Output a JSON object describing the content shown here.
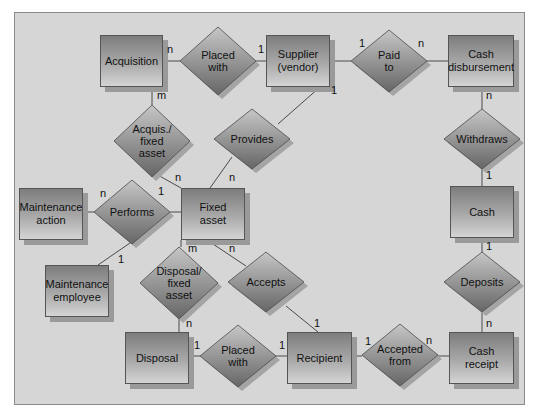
{
  "diagram": {
    "type": "entity-relationship",
    "entities": [
      {
        "id": "acquisition",
        "label": "Acquisition",
        "x": 100,
        "y": 35,
        "w": 63,
        "h": 52
      },
      {
        "id": "supplier",
        "label": "Supplier\n(vendor)",
        "x": 266,
        "y": 35,
        "w": 64,
        "h": 52
      },
      {
        "id": "cash_disbursement",
        "label": "Cash\ndisbursement",
        "x": 448,
        "y": 35,
        "w": 66,
        "h": 52
      },
      {
        "id": "maintenance_action",
        "label": "Maintenance\naction",
        "x": 19,
        "y": 188,
        "w": 64,
        "h": 52
      },
      {
        "id": "fixed_asset",
        "label": "Fixed\nasset",
        "x": 181,
        "y": 188,
        "w": 64,
        "h": 52
      },
      {
        "id": "cash",
        "label": "Cash",
        "x": 450,
        "y": 186,
        "w": 64,
        "h": 52
      },
      {
        "id": "maintenance_employee",
        "label": "Maintenance\nemployee",
        "x": 45,
        "y": 265,
        "w": 64,
        "h": 52
      },
      {
        "id": "disposal",
        "label": "Disposal",
        "x": 125,
        "y": 332,
        "w": 64,
        "h": 52
      },
      {
        "id": "recipient",
        "label": "Recipient",
        "x": 287,
        "y": 332,
        "w": 65,
        "h": 52
      },
      {
        "id": "cash_receipt",
        "label": "Cash\nreceipt",
        "x": 449,
        "y": 332,
        "w": 65,
        "h": 52
      }
    ],
    "relationships": [
      {
        "id": "placed_with_top",
        "label": "Placed\nwith",
        "cx": 218,
        "cy": 61,
        "hw": 38,
        "hh": 34
      },
      {
        "id": "paid_to",
        "label": "Paid\nto",
        "cx": 389,
        "cy": 61,
        "hw": 38,
        "hh": 31
      },
      {
        "id": "acquis_fixed_asset",
        "label": "Acquis./\nfixed\nasset",
        "cx": 152,
        "cy": 141,
        "hw": 38,
        "hh": 36
      },
      {
        "id": "provides",
        "label": "Provides",
        "cx": 252,
        "cy": 139,
        "hw": 38,
        "hh": 30
      },
      {
        "id": "withdraws",
        "label": "Withdraws",
        "cx": 482,
        "cy": 139,
        "hw": 38,
        "hh": 30
      },
      {
        "id": "performs",
        "label": "Performs",
        "cx": 132,
        "cy": 212,
        "hw": 38,
        "hh": 32
      },
      {
        "id": "disposal_fixed_asset",
        "label": "Disposal/\nfixed\nasset",
        "cx": 179,
        "cy": 283,
        "hw": 39,
        "hh": 36
      },
      {
        "id": "accepts",
        "label": "Accepts",
        "cx": 266,
        "cy": 282,
        "hw": 38,
        "hh": 30
      },
      {
        "id": "deposits",
        "label": "Deposits",
        "cx": 482,
        "cy": 282,
        "hw": 38,
        "hh": 30
      },
      {
        "id": "placed_with_bottom",
        "label": "Placed\nwith",
        "cx": 238,
        "cy": 356,
        "hw": 38,
        "hh": 31
      },
      {
        "id": "accepted_from",
        "label": "Accepted\nfrom",
        "cx": 400,
        "cy": 355,
        "hw": 38,
        "hh": 31
      }
    ],
    "connectors": [
      {
        "from": [
          163,
          61
        ],
        "to": [
          180,
          61
        ]
      },
      {
        "from": [
          256,
          61
        ],
        "to": [
          266,
          61
        ]
      },
      {
        "from": [
          330,
          61
        ],
        "to": [
          351,
          61
        ]
      },
      {
        "from": [
          427,
          61
        ],
        "to": [
          448,
          61
        ]
      },
      {
        "from": [
          152,
          87
        ],
        "to": [
          152,
          105
        ]
      },
      {
        "from": [
          156,
          174
        ],
        "to": [
          181,
          188
        ]
      },
      {
        "from": [
          320,
          87
        ],
        "to": [
          278,
          124
        ]
      },
      {
        "from": [
          232,
          157
        ],
        "to": [
          210,
          188
        ]
      },
      {
        "from": [
          482,
          87
        ],
        "to": [
          482,
          109
        ]
      },
      {
        "from": [
          482,
          169
        ],
        "to": [
          482,
          186
        ]
      },
      {
        "from": [
          83,
          212
        ],
        "to": [
          94,
          212
        ]
      },
      {
        "from": [
          170,
          212
        ],
        "to": [
          181,
          212
        ]
      },
      {
        "from": [
          130,
          243
        ],
        "to": [
          98,
          265
        ]
      },
      {
        "from": [
          181,
          240
        ],
        "to": [
          181,
          247
        ]
      },
      {
        "from": [
          179,
          319
        ],
        "to": [
          179,
          332
        ]
      },
      {
        "from": [
          207,
          240
        ],
        "to": [
          246,
          266
        ]
      },
      {
        "from": [
          286,
          306
        ],
        "to": [
          318,
          332
        ]
      },
      {
        "from": [
          482,
          238
        ],
        "to": [
          482,
          252
        ]
      },
      {
        "from": [
          482,
          312
        ],
        "to": [
          482,
          332
        ]
      },
      {
        "from": [
          189,
          356
        ],
        "to": [
          200,
          356
        ]
      },
      {
        "from": [
          276,
          356
        ],
        "to": [
          287,
          356
        ]
      },
      {
        "from": [
          352,
          356
        ],
        "to": [
          362,
          356
        ]
      },
      {
        "from": [
          438,
          356
        ],
        "to": [
          449,
          356
        ]
      }
    ],
    "cardinalities": [
      {
        "text": "n",
        "x": 167,
        "y": 44
      },
      {
        "text": "1",
        "x": 258,
        "y": 44
      },
      {
        "text": "m",
        "x": 157,
        "y": 90
      },
      {
        "text": "1",
        "x": 359,
        "y": 38
      },
      {
        "text": "n",
        "x": 418,
        "y": 38
      },
      {
        "text": "1",
        "x": 331,
        "y": 85
      },
      {
        "text": "n",
        "x": 486,
        "y": 90
      },
      {
        "text": "n",
        "x": 175,
        "y": 172
      },
      {
        "text": "n",
        "x": 229,
        "y": 172
      },
      {
        "text": "1",
        "x": 486,
        "y": 170
      },
      {
        "text": "n",
        "x": 100,
        "y": 188
      },
      {
        "text": "1",
        "x": 158,
        "y": 186
      },
      {
        "text": "1",
        "x": 118,
        "y": 254
      },
      {
        "text": "m",
        "x": 188,
        "y": 243
      },
      {
        "text": "n",
        "x": 229,
        "y": 243
      },
      {
        "text": "1",
        "x": 486,
        "y": 241
      },
      {
        "text": "n",
        "x": 186,
        "y": 318
      },
      {
        "text": "1",
        "x": 314,
        "y": 318
      },
      {
        "text": "n",
        "x": 486,
        "y": 318
      },
      {
        "text": "1",
        "x": 194,
        "y": 340
      },
      {
        "text": "1",
        "x": 279,
        "y": 340
      },
      {
        "text": "1",
        "x": 365,
        "y": 336
      },
      {
        "text": "n",
        "x": 426,
        "y": 335
      }
    ],
    "colors": {
      "background": "#d6d6d6",
      "entity_top": "#7d7d7d",
      "entity_bottom": "#d4d4d4",
      "diamond_top": "#c4c4c4",
      "diamond_bottom": "#6c6c6c",
      "line": "#4a4a4a"
    }
  }
}
